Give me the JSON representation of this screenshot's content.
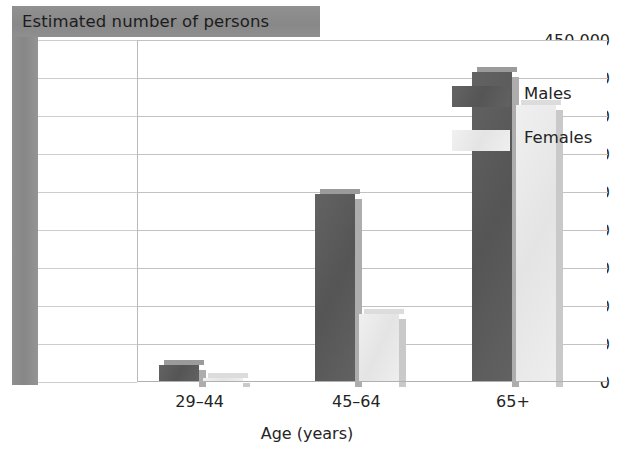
{
  "chart_data": {
    "type": "bar",
    "title": "Estimated number of persons",
    "xlabel": "Age (years)",
    "ylabel": "",
    "categories": [
      "29–44",
      "45–64",
      "65+"
    ],
    "series": [
      {
        "name": "Males",
        "color": "#5b5b5b",
        "values": [
          23000,
          247000,
          408000
        ]
      },
      {
        "name": "Females",
        "color": "#e9e9e9",
        "values": [
          5000,
          90000,
          364000
        ]
      }
    ],
    "ylim": [
      0,
      450000
    ],
    "ytick_values": [
      0,
      50000,
      100000,
      150000,
      200000,
      250000,
      300000,
      350000,
      400000,
      450000
    ],
    "ytick_labels": [
      "0",
      "50,000",
      "100,000",
      "150,000",
      "200,000",
      "250,000",
      "300,000",
      "350,000",
      "400,000",
      "450,000"
    ],
    "grid": true,
    "legend_position": "top-right",
    "legend_entries": [
      "Males",
      "Females"
    ]
  },
  "colors": {
    "band_gray": "#8d8d8d",
    "males": "#5b5b5b",
    "females": "#e9e9e9",
    "gridline": "#c2c2c2",
    "text": "#242424"
  }
}
